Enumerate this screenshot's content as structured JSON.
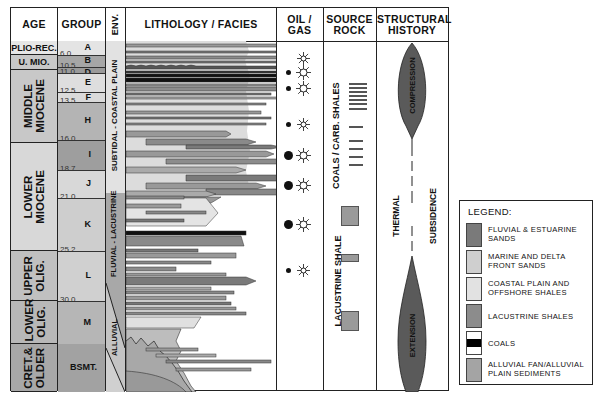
{
  "headers": {
    "age": "AGE",
    "group": "GROUP",
    "env": "ENV.",
    "lithology": "LITHOLOGY /  FACIES",
    "oil_gas": "OIL / GAS",
    "source_rock": "SOURCE ROCK",
    "structural_history": "STRUCTURAL HISTORY"
  },
  "ages": [
    {
      "label": "PLIO-REC.",
      "top": 33,
      "height": 14,
      "rotated": false,
      "color": "#e6e6e6"
    },
    {
      "label": "U. MIO.",
      "top": 47,
      "height": 15,
      "rotated": false,
      "color": "#c8c8c8"
    },
    {
      "label": "MIDDLE MIOCENE",
      "top": 62,
      "height": 73,
      "rotated": true,
      "color": "#c8c8c8"
    },
    {
      "label": "LOWER MIOCENE",
      "top": 135,
      "height": 108,
      "rotated": true,
      "color": "#d8d8d8"
    },
    {
      "label": "UPPER OLIG.",
      "top": 243,
      "height": 50,
      "rotated": true,
      "color": "#c0c0c0"
    },
    {
      "label": "LOWER OLIG.",
      "top": 293,
      "height": 43,
      "rotated": true,
      "color": "#b8b8b8"
    },
    {
      "label": "CRET.& OLDER",
      "top": 336,
      "height": 48,
      "rotated": true,
      "color": "#a8a8a8"
    }
  ],
  "groups": [
    {
      "letter": "A",
      "top": 33,
      "height": 14,
      "color": "#e4e4e4"
    },
    {
      "letter": "B",
      "top": 47,
      "height": 12,
      "color": "#a6a6a6"
    },
    {
      "letter": "D",
      "top": 59,
      "height": 6,
      "color": "#9a9a9a"
    },
    {
      "letter": "E",
      "top": 65,
      "height": 19,
      "color": "#dedede"
    },
    {
      "letter": "F",
      "top": 84,
      "height": 10,
      "color": "#dadada"
    },
    {
      "letter": "H",
      "top": 94,
      "height": 38,
      "color": "#b4b4b4"
    },
    {
      "letter": "I",
      "top": 132,
      "height": 30,
      "color": "#9e9e9e"
    },
    {
      "letter": "J",
      "top": 162,
      "height": 28,
      "color": "#d8d8d8"
    },
    {
      "letter": "K",
      "top": 190,
      "height": 53,
      "color": "#cecece"
    },
    {
      "letter": "L",
      "top": 243,
      "height": 50,
      "color": "#d0d0d0"
    },
    {
      "letter": "M",
      "top": 293,
      "height": 43,
      "color": "#b6b6b6"
    },
    {
      "letter": "BSMT.",
      "top": 336,
      "height": 48,
      "color": "#a2a2a2"
    }
  ],
  "group_ages": [
    {
      "label": "6.0",
      "y": 47
    },
    {
      "label": "10.5",
      "y": 59
    },
    {
      "label": "11.0",
      "y": 65
    },
    {
      "label": "12.5",
      "y": 84
    },
    {
      "label": "13.5",
      "y": 94
    },
    {
      "label": "16.0",
      "y": 132
    },
    {
      "label": "18.7",
      "y": 162
    },
    {
      "label": "21.0",
      "y": 190
    },
    {
      "label": "25.2",
      "y": 243
    },
    {
      "label": "30.0",
      "y": 293
    }
  ],
  "environments": [
    {
      "label": "SUBTIDAL - COASTAL PLAIN"
    },
    {
      "label": "FLUVIAL - LACUSTRINE"
    },
    {
      "label": "ALLUVIAL"
    }
  ],
  "oil_gas": [
    {
      "y": 50,
      "oil": 0,
      "gas": 7
    },
    {
      "y": 64,
      "oil": 5,
      "gas": 9
    },
    {
      "y": 80,
      "oil": 5,
      "gas": 9
    },
    {
      "y": 116,
      "oil": 5,
      "gas": 7
    },
    {
      "y": 147,
      "oil": 9,
      "gas": 9
    },
    {
      "y": 177,
      "oil": 9,
      "gas": 9
    },
    {
      "y": 216,
      "oil": 9,
      "gas": 9
    },
    {
      "y": 262,
      "oil": 5,
      "gas": 7
    }
  ],
  "source_rock": {
    "coals_label": "COALS / CARB. SHALES",
    "lacustrine_label": "LACUSTRINE SHALE"
  },
  "structural": {
    "compression": "COMPRESSION",
    "thermal": "THERMAL",
    "subsidence": "SUBSIDENCE",
    "extension": "EXTENSION",
    "fill": "#5a5a5a"
  },
  "legend": {
    "title": "LEGEND:",
    "items": [
      {
        "label": "FLUVIAL & ESTUARINE SANDS",
        "color": "#7a7a7a"
      },
      {
        "label": "MARINE AND DELTA FRONT SANDS",
        "color": "#cfcfcf"
      },
      {
        "label": "COASTAL PLAIN AND OFFSHORE SHALES",
        "color": "#e2e2e2"
      },
      {
        "label": "LACUSTRINE SHALES",
        "color": "#8c8c8c"
      },
      {
        "label": "COALS",
        "color": "coal"
      },
      {
        "label": "ALLUVIAL FAN/ALLUVIAL PLAIN SEDIMENTS",
        "color": "#a4a4a4"
      }
    ]
  }
}
